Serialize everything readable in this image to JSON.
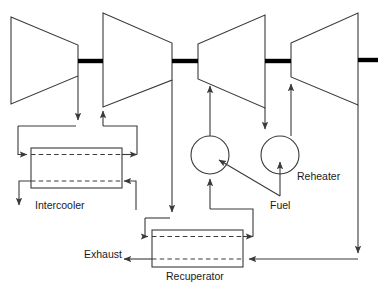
{
  "diagram": {
    "labels": {
      "intercooler": "Intercooler",
      "exhaust": "Exhaust",
      "recuperator": "Recuperator",
      "fuel": "Fuel",
      "reheater": "Reheater",
      "corner_fragment": ""
    },
    "colors": {
      "line": "#3a3a3a",
      "shaft": "#000000",
      "dashed": "#3a3a3a",
      "text": "#1a1a1a",
      "background": "#ffffff"
    },
    "components": [
      {
        "name": "compressor-1",
        "type": "compressor",
        "shape": "trapezoid-narrowing-right"
      },
      {
        "name": "compressor-2",
        "type": "compressor",
        "shape": "trapezoid-narrowing-right"
      },
      {
        "name": "turbine-1",
        "type": "turbine",
        "shape": "trapezoid-widening-right"
      },
      {
        "name": "turbine-2",
        "type": "turbine",
        "shape": "trapezoid-widening-right"
      },
      {
        "name": "intercooler",
        "type": "heat-exchanger",
        "shape": "rect-dashed"
      },
      {
        "name": "recuperator",
        "type": "heat-exchanger",
        "shape": "rect-dashed"
      },
      {
        "name": "combustor",
        "type": "combustor",
        "shape": "circle"
      },
      {
        "name": "reheater",
        "type": "combustor",
        "shape": "circle"
      }
    ],
    "shafts": [
      {
        "name": "shaft-1"
      },
      {
        "name": "shaft-2"
      },
      {
        "name": "shaft-3"
      },
      {
        "name": "shaft-4"
      }
    ]
  }
}
